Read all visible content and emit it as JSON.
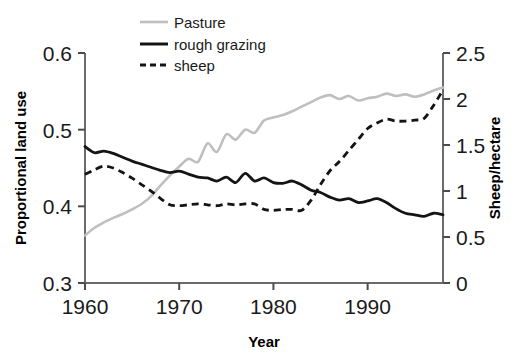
{
  "chart_data": {
    "type": "line",
    "title": "",
    "xlabel": "Year",
    "ylabel": "Proportional land use",
    "y2label": "Sheep/hectare",
    "xlim": [
      1960,
      1998
    ],
    "ylim": [
      0.3,
      0.6
    ],
    "y2lim": [
      0,
      2.5
    ],
    "grid": false,
    "legend_position": "top-center",
    "x_ticks": [
      "1960",
      "1970",
      "1980",
      "1990"
    ],
    "x_tick_values": [
      1960,
      1970,
      1980,
      1990
    ],
    "y_ticks": [
      "0.3",
      "0.4",
      "0.5",
      "0.6"
    ],
    "y_tick_values": [
      0.3,
      0.4,
      0.5,
      0.6
    ],
    "y2_ticks": [
      "0",
      "0.5",
      "1",
      "1.5",
      "2",
      "2.5"
    ],
    "y2_tick_values": [
      0,
      0.5,
      1,
      1.5,
      2,
      2.5
    ],
    "x": [
      1960,
      1961,
      1962,
      1963,
      1964,
      1965,
      1966,
      1967,
      1968,
      1969,
      1970,
      1971,
      1972,
      1973,
      1974,
      1975,
      1976,
      1977,
      1978,
      1979,
      1980,
      1981,
      1982,
      1983,
      1984,
      1985,
      1986,
      1987,
      1988,
      1989,
      1990,
      1991,
      1992,
      1993,
      1994,
      1995,
      1996,
      1997,
      1998
    ],
    "series": [
      {
        "name": "Pasture",
        "axis": "left",
        "color": "#bfbfbf",
        "style": "solid",
        "values": [
          0.362,
          0.372,
          0.379,
          0.385,
          0.39,
          0.396,
          0.403,
          0.413,
          0.427,
          0.44,
          0.452,
          0.462,
          0.458,
          0.482,
          0.471,
          0.494,
          0.487,
          0.5,
          0.496,
          0.512,
          0.516,
          0.519,
          0.524,
          0.53,
          0.536,
          0.542,
          0.545,
          0.54,
          0.544,
          0.538,
          0.541,
          0.543,
          0.547,
          0.544,
          0.546,
          0.543,
          0.546,
          0.551,
          0.555
        ]
      },
      {
        "name": "rough grazing",
        "axis": "left",
        "color": "#141414",
        "style": "solid",
        "values": [
          0.478,
          0.47,
          0.472,
          0.469,
          0.464,
          0.459,
          0.455,
          0.451,
          0.447,
          0.444,
          0.446,
          0.442,
          0.438,
          0.437,
          0.433,
          0.438,
          0.431,
          0.443,
          0.433,
          0.437,
          0.431,
          0.43,
          0.433,
          0.428,
          0.421,
          0.418,
          0.412,
          0.408,
          0.41,
          0.405,
          0.407,
          0.41,
          0.405,
          0.397,
          0.391,
          0.389,
          0.387,
          0.391,
          0.389
        ]
      },
      {
        "name": "sheep",
        "axis": "right",
        "color": "#141414",
        "style": "dashed",
        "values": [
          1.18,
          1.23,
          1.27,
          1.25,
          1.2,
          1.14,
          1.07,
          1.0,
          0.92,
          0.85,
          0.84,
          0.85,
          0.86,
          0.85,
          0.84,
          0.86,
          0.85,
          0.86,
          0.86,
          0.8,
          0.79,
          0.8,
          0.8,
          0.79,
          0.9,
          1.07,
          1.22,
          1.32,
          1.44,
          1.56,
          1.68,
          1.74,
          1.78,
          1.76,
          1.76,
          1.77,
          1.79,
          1.93,
          2.1
        ]
      }
    ]
  },
  "legend": {
    "items": [
      {
        "label": "Pasture"
      },
      {
        "label": "rough grazing"
      },
      {
        "label": "sheep"
      }
    ]
  },
  "axes": {
    "left_title": "Proportional land use",
    "right_title": "Sheep/hectare",
    "bottom_title": "Year"
  }
}
